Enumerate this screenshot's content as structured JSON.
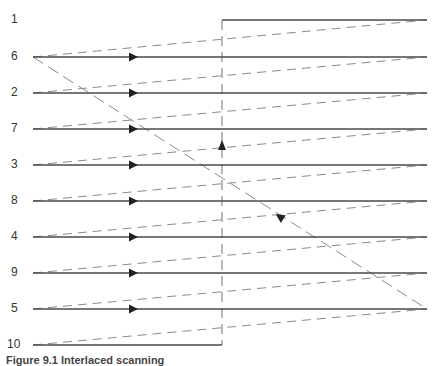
{
  "diagram": {
    "type": "interlaced-scanning",
    "colors": {
      "solid_line": "#4a4a4a",
      "dashed_line": "#8a8a8a",
      "label": "#333333"
    },
    "rows": [
      {
        "label": "1",
        "y": 20,
        "x1": 222,
        "x2": 427,
        "arrow": false
      },
      {
        "label": "6",
        "y": 57,
        "x1": 33,
        "x2": 427,
        "arrow": true
      },
      {
        "label": "2",
        "y": 93,
        "x1": 33,
        "x2": 427,
        "arrow": true
      },
      {
        "label": "7",
        "y": 129,
        "x1": 33,
        "x2": 427,
        "arrow": true
      },
      {
        "label": "3",
        "y": 165,
        "x1": 33,
        "x2": 427,
        "arrow": true
      },
      {
        "label": "8",
        "y": 201,
        "x1": 33,
        "x2": 427,
        "arrow": true
      },
      {
        "label": "4",
        "y": 237,
        "x1": 33,
        "x2": 427,
        "arrow": true
      },
      {
        "label": "9",
        "y": 273,
        "x1": 33,
        "x2": 427,
        "arrow": true
      },
      {
        "label": "5",
        "y": 309,
        "x1": 33,
        "x2": 427,
        "arrow": true
      },
      {
        "label": "10",
        "y": 345,
        "x1": 33,
        "x2": 222,
        "arrow": false
      }
    ],
    "vertical_retrace": {
      "x": 222,
      "y1": 20,
      "y2": 345,
      "arrow_y": 145,
      "direction": "up"
    },
    "field_retrace": {
      "x1": 33,
      "y1": 57,
      "x2": 427,
      "y2": 309,
      "arrow_x": 280,
      "arrow_y": 217,
      "direction": "up-left"
    },
    "caption": "Figure 9.1 Interlaced scanning"
  }
}
